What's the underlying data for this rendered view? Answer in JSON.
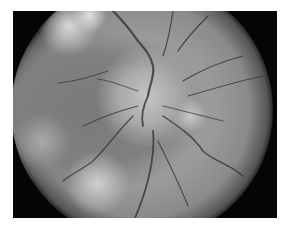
{
  "image": {
    "description": "Grayscale fundus photograph of the retina showing optic disc with radiating blood vessels and pale patches",
    "colors": {
      "background": "#ffffff",
      "frame": "#050505",
      "retina": "#9a9a9a",
      "vessel": "#3a3a3a",
      "patch": "#d8d8d8"
    }
  }
}
